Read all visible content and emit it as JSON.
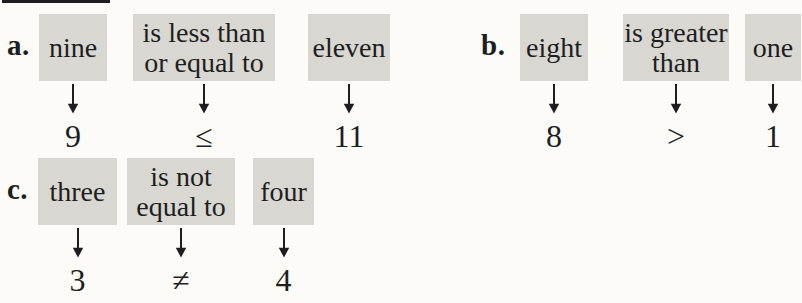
{
  "page": {
    "background_color": "#fcfbf8",
    "highlight_color": "#d8d7d2",
    "ink_color": "#1e1e1e"
  },
  "examples": [
    {
      "label": "a.",
      "terms": [
        {
          "lines": [
            "nine"
          ],
          "symbol": "9"
        },
        {
          "lines": [
            "is less than",
            "or equal to"
          ],
          "symbol": "≤"
        },
        {
          "lines": [
            "eleven"
          ],
          "symbol": "11"
        }
      ]
    },
    {
      "label": "b.",
      "terms": [
        {
          "lines": [
            "eight"
          ],
          "symbol": "8"
        },
        {
          "lines": [
            "is greater",
            "than"
          ],
          "symbol": ">"
        },
        {
          "lines": [
            "one"
          ],
          "symbol": "1"
        }
      ]
    },
    {
      "label": "c.",
      "terms": [
        {
          "lines": [
            "three"
          ],
          "symbol": "3"
        },
        {
          "lines": [
            "is not",
            "equal to"
          ],
          "symbol": "≠"
        },
        {
          "lines": [
            "four"
          ],
          "symbol": "4"
        }
      ]
    }
  ]
}
